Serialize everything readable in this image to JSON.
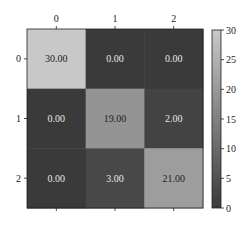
{
  "chart_data": {
    "type": "heatmap",
    "title": "",
    "xlabel": "",
    "ylabel": "",
    "x_tick_labels": [
      "0",
      "1",
      "2"
    ],
    "y_tick_labels": [
      "0",
      "1",
      "2"
    ],
    "x_ticks_position": "top",
    "matrix": [
      [
        30,
        0,
        0
      ],
      [
        0,
        19,
        2
      ],
      [
        0,
        3,
        21
      ]
    ],
    "cell_text": [
      [
        "30.00",
        "0.00",
        "0.00"
      ],
      [
        "0.00",
        "19.00",
        "2.00"
      ],
      [
        "0.00",
        "3.00",
        "21.00"
      ]
    ],
    "colormap": "gray",
    "colormap_low": "#3a3a3a",
    "colormap_high": "#c8c8c8",
    "vmin": 0,
    "vmax": 30,
    "colorbar": {
      "position": "right",
      "ticks": [
        0,
        5,
        10,
        15,
        20,
        25,
        30
      ],
      "tick_labels": [
        "0",
        "5",
        "10",
        "15",
        "20",
        "25",
        "30"
      ]
    },
    "grid": false
  }
}
